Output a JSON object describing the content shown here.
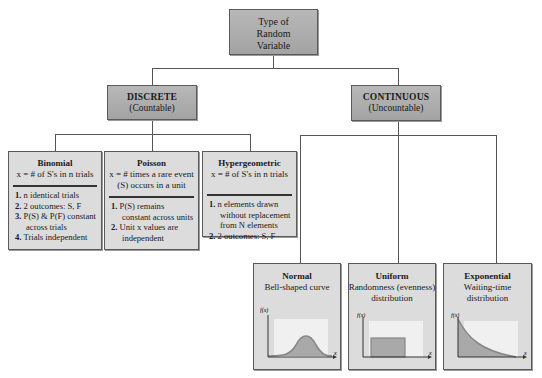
{
  "root": {
    "title_lines": [
      "Type of",
      "Random",
      "Variable"
    ]
  },
  "categories": [
    {
      "id": "discrete",
      "title": "DISCRETE",
      "subtitle": "(Countable)"
    },
    {
      "id": "continuous",
      "title": "CONTINUOUS",
      "subtitle": "(Uncountable)"
    }
  ],
  "discrete": [
    {
      "name": "Binomial",
      "definition": "x = # of S's in n trials",
      "items": [
        {
          "num": "1.",
          "text": "n identical trials"
        },
        {
          "num": "2.",
          "text": "2 outcomes: S, F"
        },
        {
          "num": "3.",
          "text": "P(S) & P(F) constant across trials"
        },
        {
          "num": "4.",
          "text": "Trials independent"
        }
      ]
    },
    {
      "name": "Poisson",
      "definition": "x = # times a rare event (S) occurs in a unit",
      "items": [
        {
          "num": "1.",
          "text": "P(S) remains constant across units"
        },
        {
          "num": "2.",
          "text": "Unit x values are independent"
        }
      ]
    },
    {
      "name": "Hypergeometric",
      "definition": "x = # of S's in n trials",
      "items": [
        {
          "num": "1.",
          "text": "n elements drawn without replacement from N elements"
        },
        {
          "num": "2.",
          "text": "2 outcomes: S, F"
        }
      ]
    }
  ],
  "continuous": [
    {
      "name": "Normal",
      "description_lines": [
        "Bell-shaped curve"
      ],
      "plot": "bell-curve",
      "y_label": "f(x)",
      "x_label": "x"
    },
    {
      "name": "Uniform",
      "description_lines": [
        "Randomness (evenness)",
        "distribution"
      ],
      "plot": "rectangle",
      "y_label": "f(x)",
      "x_label": "x"
    },
    {
      "name": "Exponential",
      "description_lines": [
        "Waiting-time",
        "distribution"
      ],
      "plot": "decay-curve",
      "y_label": "f(x)",
      "x_label": "x"
    }
  ],
  "colors": {
    "dark_box": "#acacac",
    "light_box": "#dcdcdc",
    "plot_bg": "#f0f0f0",
    "plot_fill": "#a9a9a9",
    "curve": "#8a8a8a",
    "line": "#555555"
  }
}
